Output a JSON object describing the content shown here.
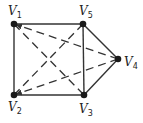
{
  "graph": {
    "nodes": [
      {
        "id": "v1",
        "label": "V",
        "sub": "1",
        "x": 14,
        "y": 24,
        "lx": 8,
        "ly": 15
      },
      {
        "id": "v2",
        "label": "V",
        "sub": "2",
        "x": 14,
        "y": 95,
        "lx": 8,
        "ly": 111
      },
      {
        "id": "v3",
        "label": "V",
        "sub": "3",
        "x": 84,
        "y": 95,
        "lx": 79,
        "ly": 113
      },
      {
        "id": "v4",
        "label": "V",
        "sub": "4",
        "x": 118,
        "y": 59,
        "lx": 124,
        "ly": 66
      },
      {
        "id": "v5",
        "label": "V",
        "sub": "5",
        "x": 83,
        "y": 24,
        "lx": 79,
        "ly": 15
      }
    ],
    "solid_edges": [
      [
        "v1",
        "v5"
      ],
      [
        "v1",
        "v2"
      ],
      [
        "v2",
        "v3"
      ],
      [
        "v5",
        "v3"
      ],
      [
        "v5",
        "v4"
      ],
      [
        "v3",
        "v4"
      ]
    ],
    "dashed_edges": [
      [
        "v1",
        "v3"
      ],
      [
        "v5",
        "v2"
      ],
      [
        "v4",
        "v1"
      ],
      [
        "v4",
        "v2"
      ]
    ],
    "colors": {
      "edge": "#333333",
      "node": "#1a1a1a"
    }
  }
}
